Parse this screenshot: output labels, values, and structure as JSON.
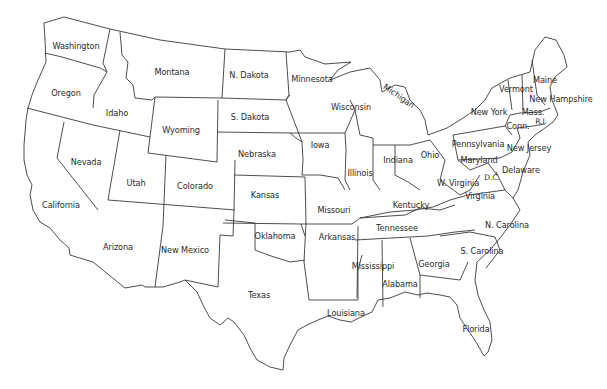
{
  "map": {
    "title": "",
    "type": "Outline map of the contiguous United States",
    "line_color": "#3a3a3a",
    "background": "#ffffff",
    "states": [
      {
        "label": "Washington",
        "x": 76,
        "y": 46
      },
      {
        "label": "Oregon",
        "x": 66,
        "y": 93
      },
      {
        "label": "Idaho",
        "x": 117,
        "y": 113
      },
      {
        "label": "Montana",
        "x": 172,
        "y": 72
      },
      {
        "label": "Wyoming",
        "x": 181,
        "y": 130
      },
      {
        "label": "N. Dakota",
        "x": 249,
        "y": 75
      },
      {
        "label": "S. Dakota",
        "x": 250,
        "y": 117
      },
      {
        "label": "Nebraska",
        "x": 257,
        "y": 154
      },
      {
        "label": "Minnesota",
        "x": 312,
        "y": 79
      },
      {
        "label": "Nevada",
        "x": 86,
        "y": 162
      },
      {
        "label": "Utah",
        "x": 136,
        "y": 183
      },
      {
        "label": "Colorado",
        "x": 195,
        "y": 186
      },
      {
        "label": "Kansas",
        "x": 265,
        "y": 195
      },
      {
        "label": "Iowa",
        "x": 320,
        "y": 145
      },
      {
        "label": "Wisconsin",
        "x": 351,
        "y": 107
      },
      {
        "label": "Michigan",
        "x": 399,
        "y": 96,
        "rotate": 35
      },
      {
        "label": "Illinois",
        "x": 360,
        "y": 173
      },
      {
        "label": "Indiana",
        "x": 398,
        "y": 160
      },
      {
        "label": "Ohio",
        "x": 430,
        "y": 155
      },
      {
        "label": "Missouri",
        "x": 334,
        "y": 210
      },
      {
        "label": "Kentucky",
        "x": 411,
        "y": 205
      },
      {
        "label": "California",
        "x": 61,
        "y": 205
      },
      {
        "label": "Arizona",
        "x": 118,
        "y": 247
      },
      {
        "label": "New Mexico",
        "x": 185,
        "y": 250
      },
      {
        "label": "Oklahoma",
        "x": 275,
        "y": 236
      },
      {
        "label": "Arkansas",
        "x": 337,
        "y": 237
      },
      {
        "label": "Tennessee",
        "x": 397,
        "y": 228
      },
      {
        "label": "Texas",
        "x": 259,
        "y": 295
      },
      {
        "label": "Louisiana",
        "x": 346,
        "y": 313
      },
      {
        "label": "Mississippi",
        "x": 373,
        "y": 266
      },
      {
        "label": "Alabama",
        "x": 400,
        "y": 284
      },
      {
        "label": "Georgia",
        "x": 434,
        "y": 264
      },
      {
        "label": "Florida",
        "x": 476,
        "y": 329
      },
      {
        "label": "S. Carolina",
        "x": 482,
        "y": 251
      },
      {
        "label": "N. Carolina",
        "x": 507,
        "y": 225
      },
      {
        "label": "Virginia",
        "x": 480,
        "y": 196
      },
      {
        "label": "W. Virginia",
        "x": 458,
        "y": 183
      },
      {
        "label": "Maryland",
        "x": 479,
        "y": 160
      },
      {
        "label": "D.C.",
        "x": 492,
        "y": 178,
        "small": true
      },
      {
        "label": "Delaware",
        "x": 521,
        "y": 170
      },
      {
        "label": "Pennsylvania",
        "x": 478,
        "y": 144
      },
      {
        "label": "New Jersey",
        "x": 529,
        "y": 148
      },
      {
        "label": "New York",
        "x": 489,
        "y": 112
      },
      {
        "label": "Conn.",
        "x": 518,
        "y": 126
      },
      {
        "label": "R.I.",
        "x": 541,
        "y": 122,
        "small": true
      },
      {
        "label": "Mass.",
        "x": 533,
        "y": 112
      },
      {
        "label": "Vermont",
        "x": 516,
        "y": 89
      },
      {
        "label": "New Hampshire",
        "x": 561,
        "y": 99
      },
      {
        "label": "Maine",
        "x": 545,
        "y": 80
      }
    ]
  }
}
